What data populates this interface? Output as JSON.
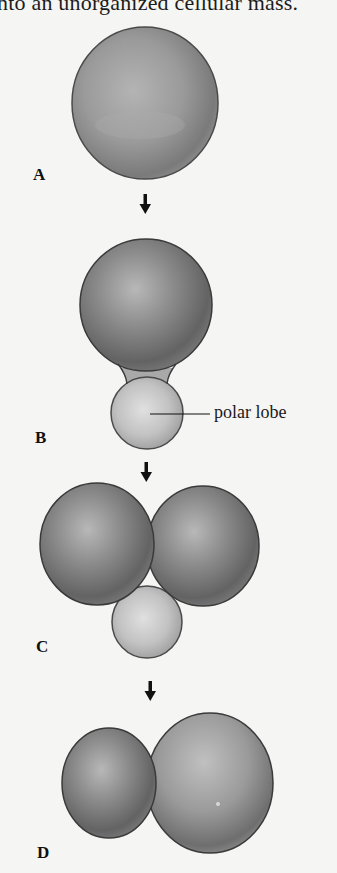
{
  "caption": {
    "text": "nto an unorganized cellular mass."
  },
  "stages": [
    {
      "id": "A",
      "label": "A"
    },
    {
      "id": "B",
      "label": "B"
    },
    {
      "id": "C",
      "label": "C"
    },
    {
      "id": "D",
      "label": "D"
    }
  ],
  "annotations": {
    "polar_lobe": "polar lobe"
  },
  "colors": {
    "background": "#f5f5f3",
    "cell_dark": "#5e5e5e",
    "cell_mid": "#8c8c8c",
    "cell_light": "#c4c4c4",
    "lobe_light": "#d2d2d2",
    "outline": "#3a3a3a"
  }
}
